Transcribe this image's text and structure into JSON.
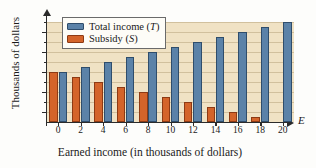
{
  "chart_data": {
    "type": "bar",
    "title": "",
    "xlabel": "Earned income (in thousands of dollars)",
    "ylabel": "Thousands of dollars",
    "x_axis_symbol": "E",
    "categories": [
      "0",
      "2",
      "4",
      "6",
      "8",
      "10",
      "12",
      "14",
      "16",
      "18",
      "20"
    ],
    "series": [
      {
        "name": "Total income (T)",
        "symbol": "T",
        "color": "#5b82a8",
        "values": [
          10,
          11,
          12,
          13,
          14,
          15,
          16,
          17,
          18,
          19,
          20
        ]
      },
      {
        "name": "Subsidy (S)",
        "symbol": "S",
        "color": "#d4642a",
        "values": [
          10,
          9,
          8,
          7,
          6,
          5,
          4,
          3,
          2,
          1,
          0
        ]
      }
    ],
    "xlim": [
      -1,
      21
    ],
    "ylim": [
      0,
      20
    ],
    "ytick_labels": [
      "2",
      "6",
      "10",
      "14",
      "18"
    ],
    "ytick_values": [
      2,
      6,
      10,
      14,
      18
    ],
    "yminor_tick_values": [
      4,
      8,
      12,
      16,
      20
    ],
    "xtick_labels": [
      "0",
      "2",
      "4",
      "6",
      "8",
      "10",
      "12",
      "14",
      "16",
      "18",
      "20"
    ],
    "grid": true,
    "grid_axis": "y",
    "legend_position": "top-left",
    "plot_background": "#f0e2c4"
  },
  "legend": {
    "entries": [
      {
        "label_prefix": "Total income (",
        "symbol": "T",
        "label_suffix": ")",
        "color": "#5b82a8"
      },
      {
        "label_prefix": "Subsidy (",
        "symbol": "S",
        "label_suffix": ")",
        "color": "#d4642a"
      }
    ]
  },
  "axis_titles": {
    "y": "Thousands of dollars",
    "x": "Earned income (in thousands of dollars)",
    "x_symbol": "E"
  }
}
